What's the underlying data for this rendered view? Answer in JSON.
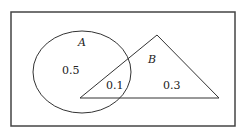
{
  "diagram": {
    "type": "venn",
    "universe_frame": true,
    "sets": [
      {
        "name": "A",
        "shape": "ellipse",
        "label": "A"
      },
      {
        "name": "B",
        "shape": "triangle",
        "label": "B"
      }
    ],
    "regions": {
      "a_only": "0.5",
      "a_and_b": "0.1",
      "b_only": "0.3"
    },
    "colors": {
      "stroke": "#333333",
      "background": "#ffffff"
    }
  }
}
